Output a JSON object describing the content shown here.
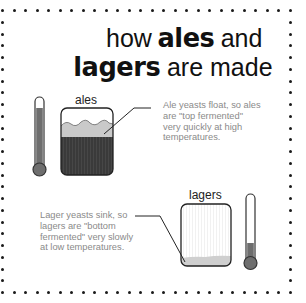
{
  "title": {
    "line1": {
      "pre": "how",
      "bold": "ales",
      "post": "and"
    },
    "line2": {
      "bold": "lagers",
      "post": "are made"
    }
  },
  "ales": {
    "label": "ales",
    "description": [
      "Ale yeasts float, so ales",
      "are \"top fermented\"",
      "very quickly at high",
      "temperatures."
    ],
    "thermometer_level": "high"
  },
  "lagers": {
    "label": "lagers",
    "description": [
      "Lager yeasts sink, so",
      "lagers are \"bottom",
      "fermented\" very slowly",
      "at low temperatures."
    ],
    "thermometer_level": "low"
  },
  "colors": {
    "border_dots": "#1a1a1a",
    "dark_liquid": "#3a3a3a",
    "foam": "#c9c9c9",
    "mercury": "#6e6e6e",
    "description_text": "#8a8a8a"
  }
}
